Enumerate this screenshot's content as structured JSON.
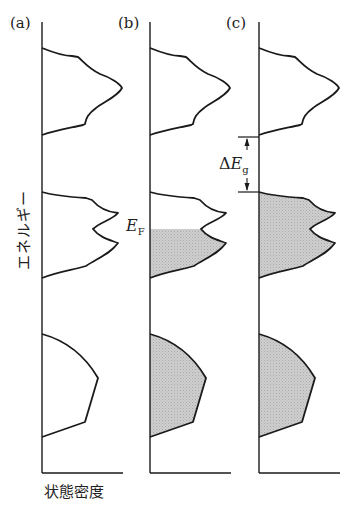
{
  "figure": {
    "title": "",
    "panels": [
      {
        "id": "a",
        "label": "(a)",
        "description": "金属・絶縁体 (empty bands)"
      },
      {
        "id": "b",
        "label": "(b)",
        "description": "Partially filled middle band with Fermi level"
      },
      {
        "id": "c",
        "label": "(c)",
        "description": "Filled bands with band gap"
      }
    ],
    "ylabel": "エネルギー",
    "xlabel": "状態密度",
    "annotations": {
      "fermi_level": {
        "symbol": "E",
        "sub": "F"
      },
      "band_gap": {
        "delta": "Δ",
        "symbol": "E",
        "sub": "g"
      }
    },
    "colors": {
      "line": "#1a1a1a",
      "fill": "#c9c9c9",
      "background": "#ffffff"
    }
  }
}
